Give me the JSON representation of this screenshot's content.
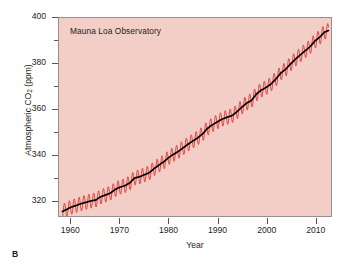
{
  "figure": {
    "panel_letter": "B",
    "background_color": "#ffffff"
  },
  "chart_data": {
    "type": "line",
    "title": "Mauna Loa Observatory",
    "xlabel": "Year",
    "ylabel": "Atmospheric CO2 (ppm)",
    "ylabel_prefix": "Atmospheric CO",
    "ylabel_sub": "2",
    "ylabel_suffix": " (ppm)",
    "xlim": [
      1957.5,
      2013.3
    ],
    "ylim": [
      313.0,
      400.0
    ],
    "grid": false,
    "legend": null,
    "plot_background_color": "#f2cec7",
    "frame_color": "#9b8d8b",
    "x_ticks": [
      1960,
      1970,
      1980,
      1990,
      2000,
      2010
    ],
    "x_tick_labels": [
      "1960",
      "1970",
      "1980",
      "1990",
      "2000",
      "2010"
    ],
    "x_minor_ticks": [],
    "y_ticks": [
      320,
      340,
      360,
      380,
      400
    ],
    "y_tick_labels": [
      "320",
      "340",
      "360",
      "380",
      "400"
    ],
    "y_minor_ticks": [
      330,
      350,
      370,
      390
    ],
    "series": [
      {
        "name": "Monthly mean CO2 (seasonal cycle)",
        "color": "#e0302a",
        "line_width": 1.0,
        "seasonal_amplitude_ppm": 3.2,
        "description": "Red sawtooth monthly record showing annual seasonal oscillation"
      },
      {
        "name": "Smoothed annual trend",
        "color": "#000000",
        "line_width": 1.6,
        "description": "Black trend line through the monthly data"
      }
    ],
    "x": [
      1958.2,
      1959,
      1960,
      1961,
      1962,
      1963,
      1964,
      1965,
      1966,
      1967,
      1968,
      1969,
      1970,
      1971,
      1972,
      1973,
      1974,
      1975,
      1976,
      1977,
      1978,
      1979,
      1980,
      1981,
      1982,
      1983,
      1984,
      1985,
      1986,
      1987,
      1988,
      1989,
      1990,
      1991,
      1992,
      1993,
      1994,
      1995,
      1996,
      1997,
      1998,
      1999,
      2000,
      2001,
      2002,
      2003,
      2004,
      2005,
      2006,
      2007,
      2008,
      2009,
      2010,
      2011,
      2012,
      2012.8
    ],
    "values": [
      315.0,
      315.8,
      316.9,
      317.6,
      318.4,
      319.0,
      319.6,
      320.0,
      321.4,
      322.2,
      323.0,
      324.6,
      325.7,
      326.3,
      327.5,
      329.7,
      330.2,
      331.1,
      332.0,
      333.8,
      335.4,
      336.8,
      338.7,
      340.1,
      341.4,
      343.0,
      344.6,
      346.0,
      347.4,
      349.2,
      351.6,
      353.1,
      354.4,
      355.6,
      356.4,
      357.1,
      358.8,
      360.8,
      362.6,
      363.8,
      366.6,
      368.3,
      369.5,
      371.0,
      373.2,
      375.8,
      377.5,
      379.8,
      381.9,
      383.8,
      385.6,
      387.4,
      389.9,
      391.6,
      393.8,
      394.5
    ]
  }
}
